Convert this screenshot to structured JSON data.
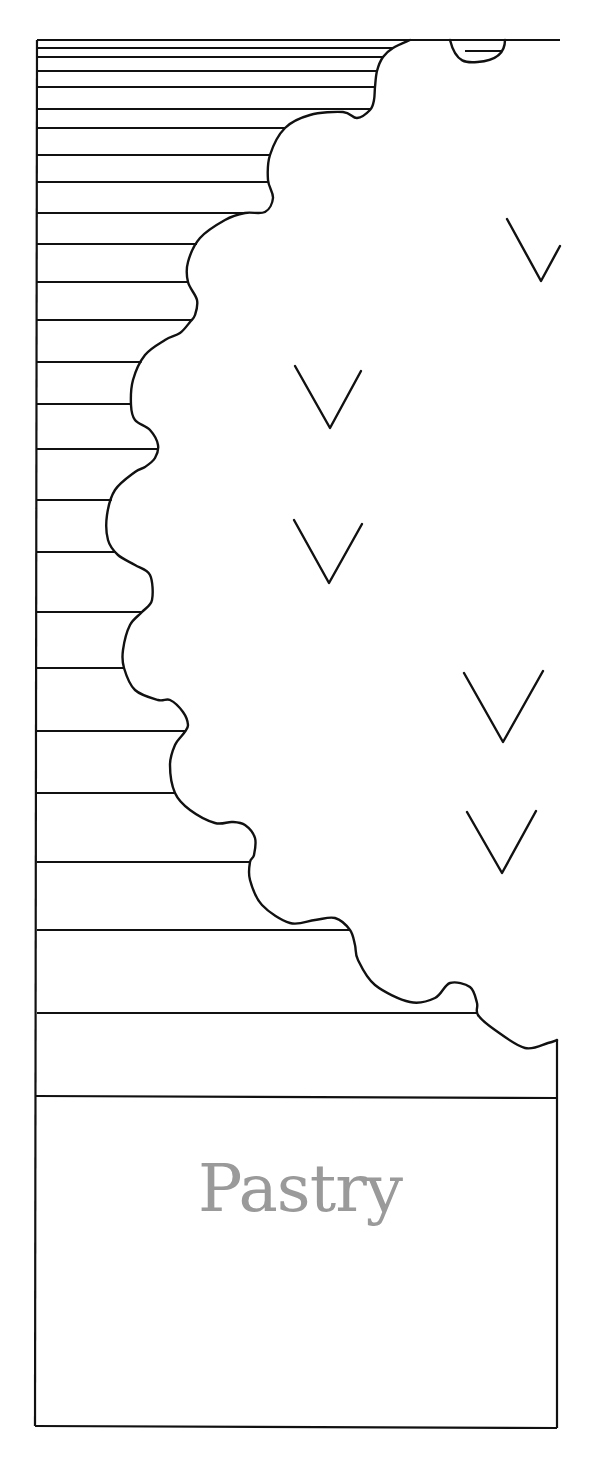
{
  "figure": {
    "type": "layered-section-diagram",
    "canvas": {
      "width": 602,
      "height": 1469
    },
    "colors": {
      "line": "#111111",
      "label": "#9a9a9a",
      "background": "#ffffff"
    },
    "frame": {
      "left_x": 37,
      "right_x": 557,
      "top_y": 40,
      "bottom_y": 1426,
      "right_edge_start_y": 1040
    },
    "layer_line_ys": [
      48,
      57,
      71,
      87,
      109,
      128,
      155,
      182,
      213,
      244,
      282,
      320,
      362,
      404,
      449,
      500,
      552,
      612,
      668,
      731,
      793,
      862,
      930,
      1013
    ],
    "base_divider_y": 1096,
    "scallop_edge_points": [
      [
        410,
        40
      ],
      [
        393,
        48
      ],
      [
        383,
        57
      ],
      [
        377,
        71
      ],
      [
        375,
        87
      ],
      [
        374,
        100
      ],
      [
        370,
        110
      ],
      [
        357,
        118
      ],
      [
        343,
        112
      ],
      [
        310,
        115
      ],
      [
        285,
        128
      ],
      [
        270,
        155
      ],
      [
        268,
        180
      ],
      [
        273,
        198
      ],
      [
        265,
        212
      ],
      [
        245,
        213
      ],
      [
        225,
        220
      ],
      [
        200,
        238
      ],
      [
        188,
        262
      ],
      [
        188,
        282
      ],
      [
        197,
        300
      ],
      [
        195,
        315
      ],
      [
        190,
        322
      ],
      [
        180,
        333
      ],
      [
        165,
        340
      ],
      [
        145,
        355
      ],
      [
        133,
        380
      ],
      [
        131,
        405
      ],
      [
        135,
        420
      ],
      [
        150,
        430
      ],
      [
        158,
        445
      ],
      [
        155,
        458
      ],
      [
        145,
        467
      ],
      [
        135,
        472
      ],
      [
        115,
        490
      ],
      [
        107,
        515
      ],
      [
        108,
        540
      ],
      [
        118,
        555
      ],
      [
        135,
        565
      ],
      [
        150,
        575
      ],
      [
        152,
        600
      ],
      [
        142,
        612
      ],
      [
        130,
        625
      ],
      [
        123,
        650
      ],
      [
        124,
        668
      ],
      [
        135,
        690
      ],
      [
        158,
        700
      ],
      [
        170,
        700
      ],
      [
        183,
        712
      ],
      [
        188,
        725
      ],
      [
        184,
        733
      ],
      [
        175,
        745
      ],
      [
        170,
        765
      ],
      [
        175,
        793
      ],
      [
        190,
        810
      ],
      [
        215,
        823
      ],
      [
        232,
        822
      ],
      [
        245,
        825
      ],
      [
        255,
        838
      ],
      [
        254,
        855
      ],
      [
        250,
        862
      ],
      [
        250,
        880
      ],
      [
        262,
        905
      ],
      [
        290,
        923
      ],
      [
        315,
        920
      ],
      [
        335,
        918
      ],
      [
        350,
        930
      ],
      [
        355,
        945
      ],
      [
        358,
        960
      ],
      [
        375,
        985
      ],
      [
        410,
        1002
      ],
      [
        435,
        998
      ],
      [
        450,
        983
      ],
      [
        470,
        987
      ],
      [
        477,
        1003
      ],
      [
        478,
        1015
      ],
      [
        495,
        1030
      ],
      [
        525,
        1048
      ],
      [
        548,
        1043
      ],
      [
        557,
        1040
      ]
    ],
    "top_small_bump": {
      "from_x": 450,
      "to_x": 505,
      "depth_y": 62,
      "inner_line_y": 51
    },
    "v_marks": [
      {
        "name": "v-mark-1",
        "points": [
          [
            507,
            219
          ],
          [
            541,
            281
          ],
          [
            560,
            246
          ]
        ]
      },
      {
        "name": "v-mark-2",
        "points": [
          [
            295,
            366
          ],
          [
            330,
            428
          ],
          [
            361,
            371
          ]
        ]
      },
      {
        "name": "v-mark-3",
        "points": [
          [
            294,
            520
          ],
          [
            329,
            583
          ],
          [
            362,
            524
          ]
        ]
      },
      {
        "name": "v-mark-4",
        "points": [
          [
            464,
            673
          ],
          [
            503,
            742
          ],
          [
            543,
            671
          ]
        ]
      },
      {
        "name": "v-mark-5",
        "points": [
          [
            467,
            812
          ],
          [
            502,
            873
          ],
          [
            536,
            811
          ]
        ]
      }
    ],
    "base_label": "Pastry"
  }
}
